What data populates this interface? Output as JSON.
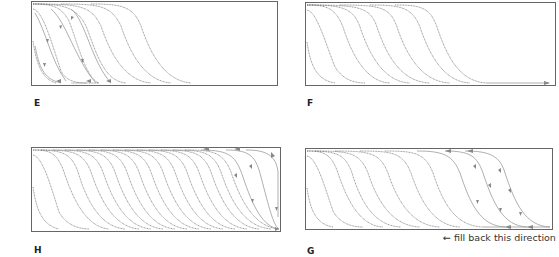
{
  "panels": [
    {
      "id": "E",
      "label": "E",
      "box": [
        31,
        1,
        247,
        85
      ],
      "curves_dark": 7,
      "curves_light_arrows": 4,
      "description": "Curves with leftward/downward arrows in lower-left region"
    },
    {
      "id": "F",
      "label": "F",
      "box": [
        305,
        2,
        251,
        84
      ],
      "curves_dark": 8,
      "bottom_arrow": "right",
      "description": "Curves filled to the right, arrow at bottom edge pointing right"
    },
    {
      "id": "H",
      "label": "H",
      "box": [
        31,
        147,
        250,
        85
      ],
      "curves_dark": 18,
      "curves_light_arrows": 3,
      "description": "Full width of curves with arrows on the right side"
    },
    {
      "id": "G",
      "label": "G",
      "box": [
        305,
        148,
        248,
        82
      ],
      "curves_dark": 8,
      "curves_light_arrows": 3,
      "description": "Separate arrowed curve group on right pointing leftward"
    }
  ],
  "caption": {
    "arrow": "←",
    "text": "fill back this direction"
  },
  "colors": {
    "dark_curve": "#555555",
    "light_curve": "#9a9a9a",
    "frame": "#666666",
    "arrow": "#888888"
  }
}
